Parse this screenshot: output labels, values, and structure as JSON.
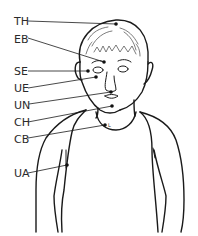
{
  "diagram": {
    "line_color": "#1a1a1a",
    "label_color": "#2a2a2a",
    "points": [
      {
        "code": "TH",
        "label_x": 14,
        "label_y": 16,
        "line_start": [
          28,
          21
        ],
        "dot": [
          116,
          24
        ]
      },
      {
        "code": "EB",
        "label_x": 14,
        "label_y": 34,
        "line_start": [
          28,
          38
        ],
        "dot": [
          104,
          62
        ]
      },
      {
        "code": "SE",
        "label_x": 14,
        "label_y": 66,
        "line_start": [
          28,
          71
        ],
        "dot": [
          88,
          71
        ]
      },
      {
        "code": "UE",
        "label_x": 14,
        "label_y": 83,
        "line_start": [
          28,
          88
        ],
        "dot": [
          96,
          77
        ]
      },
      {
        "code": "UN",
        "label_x": 14,
        "label_y": 100,
        "line_start": [
          29,
          104
        ],
        "dot": [
          111,
          92
        ]
      },
      {
        "code": "CH",
        "label_x": 14,
        "label_y": 117,
        "line_start": [
          28,
          122
        ],
        "dot": [
          112,
          106
        ]
      },
      {
        "code": "CB",
        "label_x": 14,
        "label_y": 134,
        "line_start": [
          28,
          138
        ],
        "dot": [
          105,
          125
        ]
      },
      {
        "code": "UA",
        "label_x": 14,
        "label_y": 168,
        "line_start": [
          28,
          173
        ],
        "dot": [
          67,
          165
        ]
      }
    ],
    "collarbone_side_mark": "L"
  }
}
